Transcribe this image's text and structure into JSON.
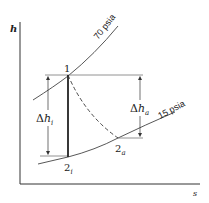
{
  "diagram": {
    "type": "h-s diagram (enthalpy-entropy), turbine expansion",
    "axes": {
      "y_label": "h",
      "x_label": "s"
    },
    "isobars": [
      {
        "label": "70 psia",
        "name": "high-pressure-line"
      },
      {
        "label": "15 psia",
        "name": "low-pressure-line"
      }
    ],
    "states": {
      "p1": {
        "label": "1"
      },
      "p2i_base": "2",
      "p2i_sub": "i",
      "p2a_base": "2",
      "p2a_sub": "a"
    },
    "dimensions": {
      "dh_i": {
        "delta": "Δ",
        "h": "h",
        "sub": "i"
      },
      "dh_a": {
        "delta": "Δ",
        "h": "h",
        "sub": "a"
      }
    },
    "colors": {
      "line": "#333333",
      "thin_line": "#555555",
      "background": "#ffffff"
    }
  }
}
